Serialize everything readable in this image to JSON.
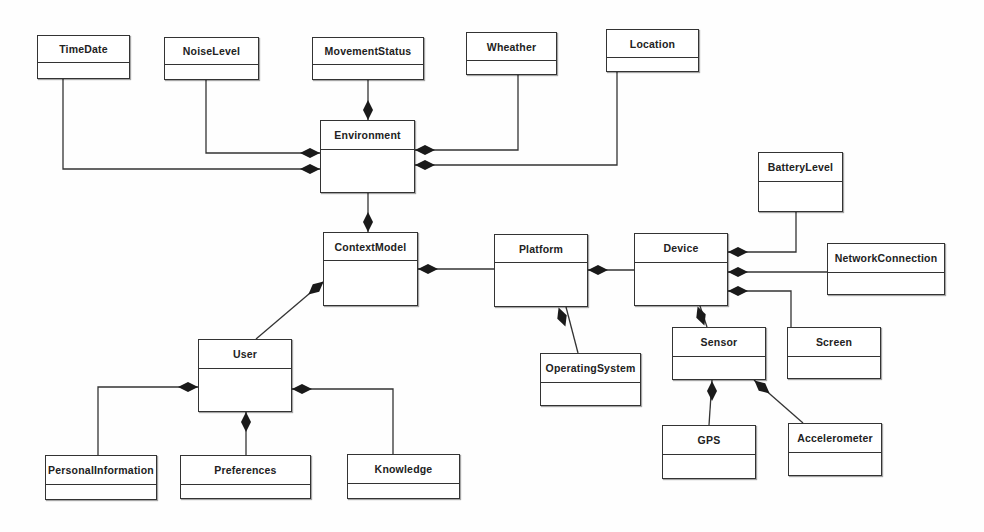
{
  "diagram": {
    "type": "UML class diagram",
    "classes": [
      {
        "id": "timedate",
        "name": "TimeDate",
        "x": 37,
        "y": 35,
        "w": 93,
        "h": 44,
        "header": 27
      },
      {
        "id": "noiselevel",
        "name": "NoiseLevel",
        "x": 164,
        "y": 37,
        "w": 95,
        "h": 43,
        "header": 27
      },
      {
        "id": "movementstatus",
        "name": "MovementStatus",
        "x": 312,
        "y": 37,
        "w": 112,
        "h": 43,
        "header": 27
      },
      {
        "id": "wheather",
        "name": "Wheather",
        "x": 466,
        "y": 32,
        "w": 91,
        "h": 43,
        "header": 28
      },
      {
        "id": "location",
        "name": "Location",
        "x": 606,
        "y": 29,
        "w": 93,
        "h": 43,
        "header": 28
      },
      {
        "id": "environment",
        "name": "Environment",
        "x": 320,
        "y": 120,
        "w": 95,
        "h": 73,
        "header": 29
      },
      {
        "id": "batterylevel",
        "name": "BatteryLevel",
        "x": 758,
        "y": 152,
        "w": 85,
        "h": 60,
        "header": 29
      },
      {
        "id": "contextmodel",
        "name": "ContextModel",
        "x": 323,
        "y": 232,
        "w": 95,
        "h": 74,
        "header": 28
      },
      {
        "id": "platform",
        "name": "Platform",
        "x": 494,
        "y": 234,
        "w": 94,
        "h": 73,
        "header": 28
      },
      {
        "id": "device",
        "name": "Device",
        "x": 634,
        "y": 233,
        "w": 94,
        "h": 73,
        "header": 29
      },
      {
        "id": "networkconnection",
        "name": "NetworkConnection",
        "x": 827,
        "y": 243,
        "w": 118,
        "h": 52,
        "header": 29
      },
      {
        "id": "user",
        "name": "User",
        "x": 198,
        "y": 339,
        "w": 94,
        "h": 73,
        "header": 29
      },
      {
        "id": "operatingsystem",
        "name": "OperatingSystem",
        "x": 540,
        "y": 353,
        "w": 101,
        "h": 53,
        "header": 29
      },
      {
        "id": "sensor",
        "name": "Sensor",
        "x": 672,
        "y": 327,
        "w": 94,
        "h": 53,
        "header": 29
      },
      {
        "id": "screen",
        "name": "Screen",
        "x": 787,
        "y": 327,
        "w": 94,
        "h": 52,
        "header": 29
      },
      {
        "id": "personalinformation",
        "name": "PersonalInformation",
        "x": 45,
        "y": 455,
        "w": 112,
        "h": 45,
        "header": 29
      },
      {
        "id": "preferences",
        "name": "Preferences",
        "x": 180,
        "y": 455,
        "w": 131,
        "h": 44,
        "header": 29
      },
      {
        "id": "knowledge",
        "name": "Knowledge",
        "x": 347,
        "y": 454,
        "w": 113,
        "h": 45,
        "header": 29
      },
      {
        "id": "gps",
        "name": "GPS",
        "x": 662,
        "y": 425,
        "w": 94,
        "h": 54,
        "header": 29
      },
      {
        "id": "accelerometer",
        "name": "Accelerometer",
        "x": 788,
        "y": 423,
        "w": 94,
        "h": 53,
        "header": 29
      }
    ],
    "compositions": [
      {
        "whole": "Environment",
        "part": "TimeDate",
        "path": [
          [
            63,
            79
          ],
          [
            63,
            169
          ],
          [
            320,
            169
          ]
        ],
        "diamond": {
          "x": 310,
          "y": 169,
          "angle": 0
        }
      },
      {
        "whole": "Environment",
        "part": "NoiseLevel",
        "path": [
          [
            206,
            80
          ],
          [
            206,
            153
          ],
          [
            320,
            153
          ]
        ],
        "diamond": {
          "x": 310,
          "y": 153,
          "angle": 0
        }
      },
      {
        "whole": "Environment",
        "part": "MovementStatus",
        "path": [
          [
            368,
            80
          ],
          [
            368,
            120
          ]
        ],
        "diamond": {
          "x": 368,
          "y": 110,
          "angle": 90
        }
      },
      {
        "whole": "Environment",
        "part": "Wheather",
        "path": [
          [
            518,
            75
          ],
          [
            518,
            150
          ],
          [
            415,
            150
          ]
        ],
        "diamond": {
          "x": 425,
          "y": 150,
          "angle": 0
        }
      },
      {
        "whole": "Environment",
        "part": "Location",
        "path": [
          [
            617,
            72
          ],
          [
            617,
            165
          ],
          [
            415,
            165
          ]
        ],
        "diamond": {
          "x": 425,
          "y": 165,
          "angle": 0
        }
      },
      {
        "whole": "ContextModel",
        "part": "Environment",
        "path": [
          [
            368,
            193
          ],
          [
            368,
            232
          ]
        ],
        "diamond": {
          "x": 368,
          "y": 222,
          "angle": 90
        }
      },
      {
        "whole": "ContextModel",
        "part": "Platform",
        "path": [
          [
            418,
            269
          ],
          [
            494,
            269
          ]
        ],
        "diamond": {
          "x": 428,
          "y": 269,
          "angle": 0
        }
      },
      {
        "whole": "ContextModel",
        "part": "User",
        "path": [
          [
            256,
            339
          ],
          [
            323,
            282
          ]
        ],
        "diamond": {
          "x": 316,
          "y": 288,
          "angle": -40
        }
      },
      {
        "whole": "Platform",
        "part": "Device",
        "path": [
          [
            588,
            270
          ],
          [
            634,
            270
          ]
        ],
        "diamond": {
          "x": 598,
          "y": 270,
          "angle": 0
        }
      },
      {
        "whole": "Platform",
        "part": "OperatingSystem",
        "path": [
          [
            566,
            307
          ],
          [
            578,
            353
          ]
        ],
        "diamond": {
          "x": 562,
          "y": 317,
          "angle": 70
        }
      },
      {
        "whole": "Device",
        "part": "BatteryLevel",
        "path": [
          [
            728,
            252
          ],
          [
            796,
            252
          ],
          [
            796,
            212
          ]
        ],
        "diamond": {
          "x": 738,
          "y": 252,
          "angle": 0
        }
      },
      {
        "whole": "Device",
        "part": "NetworkConnection",
        "path": [
          [
            728,
            272
          ],
          [
            945,
            272
          ]
        ],
        "diamond": {
          "x": 738,
          "y": 272,
          "angle": 0
        }
      },
      {
        "whole": "Device",
        "part": "Screen",
        "path": [
          [
            728,
            291
          ],
          [
            791,
            291
          ],
          [
            791,
            327
          ]
        ],
        "diamond": {
          "x": 738,
          "y": 291,
          "angle": 0
        }
      },
      {
        "whole": "Device",
        "part": "Sensor",
        "path": [
          [
            700,
            306
          ],
          [
            707,
            327
          ]
        ],
        "diamond": {
          "x": 701,
          "y": 316,
          "angle": 70
        }
      },
      {
        "whole": "User",
        "part": "PersonalInformation",
        "path": [
          [
            98,
            455
          ],
          [
            98,
            387
          ],
          [
            198,
            387
          ]
        ],
        "diamond": {
          "x": 188,
          "y": 387,
          "angle": 0
        }
      },
      {
        "whole": "User",
        "part": "Preferences",
        "path": [
          [
            246,
            455
          ],
          [
            246,
            412
          ]
        ],
        "diamond": {
          "x": 246,
          "y": 422,
          "angle": 90
        }
      },
      {
        "whole": "User",
        "part": "Knowledge",
        "path": [
          [
            393,
            454
          ],
          [
            393,
            389
          ],
          [
            292,
            389
          ]
        ],
        "diamond": {
          "x": 302,
          "y": 389,
          "angle": 0
        }
      },
      {
        "whole": "Sensor",
        "part": "GPS",
        "path": [
          [
            712,
            380
          ],
          [
            709,
            425
          ]
        ],
        "diamond": {
          "x": 712,
          "y": 391,
          "angle": 90
        }
      },
      {
        "whole": "Sensor",
        "part": "Accelerometer",
        "path": [
          [
            754,
            380
          ],
          [
            803,
            423
          ]
        ],
        "diamond": {
          "x": 762,
          "y": 387,
          "angle": 40
        }
      }
    ]
  }
}
